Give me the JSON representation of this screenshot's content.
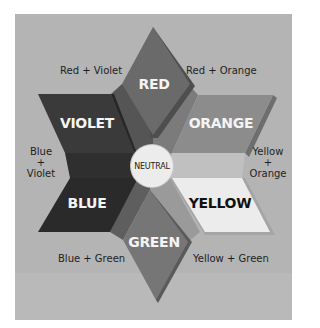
{
  "diagram": {
    "primaries_secondaries": [
      {
        "id": "red",
        "label": "RED",
        "color": "#6a6a6a"
      },
      {
        "id": "orange",
        "label": "ORANGE",
        "color": "#8c8c8c"
      },
      {
        "id": "yellow",
        "label": "YELLOW",
        "color": "#ececec"
      },
      {
        "id": "green",
        "label": "GREEN",
        "color": "#767676"
      },
      {
        "id": "blue",
        "label": "BLUE",
        "color": "#2c2c2c"
      },
      {
        "id": "violet",
        "label": "VIOLET",
        "color": "#3a3a3a"
      }
    ],
    "center": {
      "label": "NEUTRAL",
      "color": "#ececec"
    },
    "mixes": {
      "red_violet": "Red + Violet",
      "red_orange": "Red + Orange",
      "blue_violet": {
        "line1": "Blue",
        "line2": "+",
        "line3": "Violet"
      },
      "yellow_orange": {
        "line1": "Yellow",
        "line2": "+",
        "line3": "Orange"
      },
      "blue_green": "Blue + Green",
      "yellow_green": "Yellow + Green"
    },
    "background_color": "#b4b4b4"
  }
}
